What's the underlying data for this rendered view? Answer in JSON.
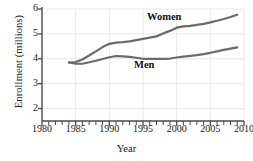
{
  "chart_data": {
    "type": "line",
    "title": "",
    "xlabel": "Year",
    "ylabel": "Enrollment (millions)",
    "xlim": [
      1980,
      2010
    ],
    "ylim": [
      1.5,
      6
    ],
    "xticks": [
      1980,
      1985,
      1990,
      1995,
      2000,
      2005,
      2010
    ],
    "xtick_labels": [
      "1980",
      "1985",
      "1990",
      "1995",
      "2000",
      "2005",
      "2010"
    ],
    "xminor_step": 1,
    "yticks": [
      2,
      3,
      4,
      5,
      6
    ],
    "ytick_labels": [
      "2",
      "3",
      "4",
      "5",
      "6"
    ],
    "grid": true,
    "grid_color": "#e8e8e8",
    "line_color": "#6b6b6b",
    "axis_color": "#4a4a4a",
    "legend_position": "inline-annotation",
    "series": [
      {
        "name": "Women",
        "label": "Women",
        "label_x": 2000,
        "label_y": 5.75,
        "x": [
          1984,
          1985,
          1986,
          1987,
          1988,
          1989,
          1990,
          1991,
          1992,
          1993,
          1994,
          1995,
          1996,
          1997,
          1998,
          1999,
          2000,
          2001,
          2002,
          2003,
          2004,
          2005,
          2006,
          2007,
          2008,
          2009
        ],
        "values": [
          3.85,
          3.87,
          3.97,
          4.13,
          4.3,
          4.47,
          4.6,
          4.65,
          4.67,
          4.7,
          4.75,
          4.8,
          4.85,
          4.9,
          5.02,
          5.12,
          5.25,
          5.3,
          5.32,
          5.36,
          5.4,
          5.46,
          5.53,
          5.6,
          5.68,
          5.77
        ]
      },
      {
        "name": "Men",
        "label": "Men",
        "label_x": 1996,
        "label_y": 3.55,
        "x": [
          1984,
          1985,
          1986,
          1987,
          1988,
          1989,
          1990,
          1991,
          1992,
          1993,
          1994,
          1995,
          1996,
          1997,
          1998,
          1999,
          2000,
          2001,
          2002,
          2003,
          2004,
          2005,
          2006,
          2007,
          2008,
          2009
        ],
        "values": [
          3.85,
          3.8,
          3.8,
          3.86,
          3.92,
          3.99,
          4.06,
          4.11,
          4.1,
          4.08,
          4.04,
          4.0,
          4.0,
          4.0,
          4.0,
          4.01,
          4.05,
          4.09,
          4.12,
          4.15,
          4.19,
          4.24,
          4.3,
          4.36,
          4.41,
          4.46
        ]
      }
    ]
  }
}
